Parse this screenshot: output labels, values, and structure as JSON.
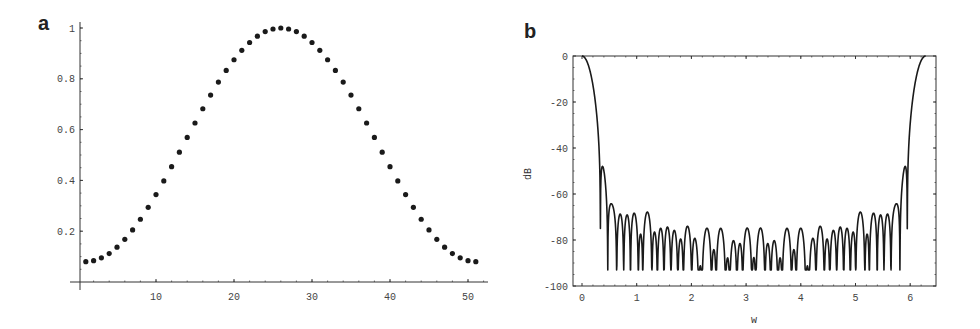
{
  "chart_data": [
    {
      "panel_label": "a",
      "type": "scatter",
      "title": "",
      "xlabel": "",
      "ylabel": "",
      "x": [
        1,
        2,
        3,
        4,
        5,
        6,
        7,
        8,
        9,
        10,
        11,
        12,
        13,
        14,
        15,
        16,
        17,
        18,
        19,
        20,
        21,
        22,
        23,
        24,
        25,
        26,
        27,
        28,
        29,
        30,
        31,
        32,
        33,
        34,
        35,
        36,
        37,
        38,
        39,
        40,
        41,
        42,
        43,
        44,
        45,
        46,
        47,
        48,
        49,
        50,
        51
      ],
      "values": [
        0.08,
        0.084,
        0.095,
        0.112,
        0.137,
        0.168,
        0.205,
        0.247,
        0.294,
        0.344,
        0.398,
        0.454,
        0.511,
        0.569,
        0.626,
        0.682,
        0.736,
        0.787,
        0.833,
        0.875,
        0.912,
        0.943,
        0.968,
        0.986,
        0.996,
        1.0,
        0.996,
        0.986,
        0.968,
        0.943,
        0.912,
        0.875,
        0.833,
        0.787,
        0.736,
        0.682,
        0.626,
        0.569,
        0.511,
        0.454,
        0.398,
        0.344,
        0.294,
        0.247,
        0.205,
        0.168,
        0.137,
        0.112,
        0.095,
        0.084,
        0.08
      ],
      "xlim": [
        0,
        52.5
      ],
      "ylim": [
        0,
        1.0
      ],
      "xticks": [
        10,
        20,
        30,
        40,
        50
      ],
      "xtick_labels": [
        "10",
        "20",
        "30",
        "40",
        "50"
      ],
      "yticks": [
        0.2,
        0.4,
        0.6,
        0.8,
        1
      ],
      "ytick_labels": [
        "0.2",
        "0.4",
        "0.6",
        "0.8",
        "1"
      ],
      "grid": false,
      "legend": null,
      "marker_color": "#1a1a1a"
    },
    {
      "panel_label": "b",
      "type": "line",
      "title": "",
      "xlabel": "w",
      "ylabel": "dB",
      "description": "Magnitude response (dB) of the 51-point window from panel a over w in [0, 2π]; main lobe 0 dB at w=0 and w=2π, sidelobe ripple between about -50 and -60 dB with nulls down to about -93 dB near w≈1.5, 3.1, 3.2, 4.8",
      "x_range": [
        0,
        6.2832
      ],
      "key_points": [
        {
          "w": 0.0,
          "dB": 0
        },
        {
          "w": 0.15,
          "dB": -5
        },
        {
          "w": 0.28,
          "dB": -55
        },
        {
          "w": 0.38,
          "dB": -72
        },
        {
          "w": 0.6,
          "dB": -50
        },
        {
          "w": 1.5,
          "dB": -93
        },
        {
          "w": 1.63,
          "dB": -88
        },
        {
          "w": 3.1,
          "dB": -93
        },
        {
          "w": 3.22,
          "dB": -93
        },
        {
          "w": 4.67,
          "dB": -88
        },
        {
          "w": 4.8,
          "dB": -93
        },
        {
          "w": 5.7,
          "dB": -50
        },
        {
          "w": 5.92,
          "dB": -72
        },
        {
          "w": 6.2832,
          "dB": 0
        }
      ],
      "floor_dB": -93,
      "xlim": [
        -0.15,
        6.45
      ],
      "ylim": [
        -100,
        0
      ],
      "xticks": [
        0,
        1,
        2,
        3,
        4,
        5,
        6
      ],
      "xtick_labels": [
        "0",
        "1",
        "2",
        "3",
        "4",
        "5",
        "6"
      ],
      "yticks": [
        0,
        -20,
        -40,
        -60,
        -80,
        -100
      ],
      "ytick_labels": [
        "0",
        "-20",
        "-40",
        "-60",
        "-80",
        "-100"
      ],
      "grid": false,
      "legend": null,
      "line_color": "#1a1a1a"
    }
  ]
}
